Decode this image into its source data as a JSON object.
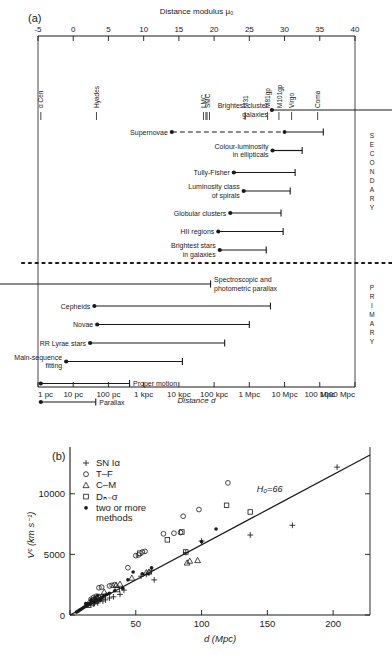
{
  "figure": {
    "panel_a_tag": "(a)",
    "panel_b_tag": "(b)"
  },
  "panel_a": {
    "top_axis_title": "Distance modulus μ₀",
    "bottom_axis_title": "Distance d",
    "top_ticks": [
      "-5",
      "0",
      "5",
      "10",
      "15",
      "20",
      "25",
      "30",
      "35",
      "40"
    ],
    "top_tick_values": [
      -5,
      0,
      5,
      10,
      15,
      20,
      25,
      30,
      35,
      40
    ],
    "bottom_ticks": [
      "1 pc",
      "10 pc",
      "100 pc",
      "1 kpc",
      "10 kpc",
      "100 kpc",
      "1 Mpc",
      "10 Mpc",
      "100 Mpc",
      "1000 Mpc"
    ],
    "side_label_secondary": "SECONDARY",
    "side_label_primary": "PRIMARY",
    "objects": [
      {
        "label": "α Cen",
        "mu": -4.6,
        "double": false
      },
      {
        "label": "Hyades",
        "mu": 3.3,
        "double": false
      },
      {
        "label": "LMC",
        "mu": 18.5,
        "double": true
      },
      {
        "label": "SMC",
        "mu": 19.0,
        "double": true
      },
      {
        "label": "M31",
        "mu": 24.4,
        "double": false
      },
      {
        "label": "M81gp",
        "mu": 27.6,
        "double": false
      },
      {
        "label": "M101gp",
        "mu": 29.2,
        "double": false
      },
      {
        "label": "Virgo",
        "mu": 31.0,
        "double": false
      },
      {
        "label": "Coma",
        "mu": 34.7,
        "double": false
      }
    ],
    "indicators_secondary": [
      {
        "label": "Brightest cluster galaxies",
        "lines": [
          "Brightest cluster",
          "galaxies"
        ],
        "dot": 28.2,
        "end": 41.5,
        "style": "solid",
        "label_side": "left",
        "overflow": true
      },
      {
        "label": "Supernovae",
        "lines": [
          "Supernovae"
        ],
        "dot": 14.0,
        "mid_dot": 30.0,
        "end": 35.5,
        "style": "dashed-then-solid",
        "label_side": "left",
        "overflow": false
      },
      {
        "label": "Colour-luminosity in ellipticals",
        "lines": [
          "Colour-luminosity",
          "in ellipticals"
        ],
        "dot": 28.3,
        "end": 32.5,
        "style": "solid",
        "label_side": "left",
        "overflow": false
      },
      {
        "label": "Tully-Fisher",
        "lines": [
          "Tully-Fisher"
        ],
        "dot": 22.8,
        "end": 31.5,
        "style": "solid",
        "label_side": "left",
        "overflow": false
      },
      {
        "label": "Luminosity class of spirals",
        "lines": [
          "Luminosity class",
          "of spirals"
        ],
        "dot": 24.2,
        "end": 30.8,
        "style": "solid",
        "label_side": "left",
        "overflow": false
      },
      {
        "label": "Globular clusters",
        "lines": [
          "Globular clusters"
        ],
        "dot": 22.3,
        "end": 29.5,
        "style": "solid",
        "label_side": "left",
        "overflow": false
      },
      {
        "label": "HII regions",
        "lines": [
          "HII regions"
        ],
        "dot": 20.6,
        "end": 29.8,
        "style": "solid",
        "label_side": "left",
        "overflow": false
      },
      {
        "label": "Brightest stars in galaxies",
        "lines": [
          "Brightest stars",
          "in galaxies"
        ],
        "dot": 20.8,
        "end": 27.4,
        "style": "solid",
        "label_side": "left",
        "overflow": false
      }
    ],
    "indicators_primary": [
      {
        "label": "Spectroscopic and photometric parallax",
        "lines": [
          "Spectroscopic and",
          "photometric parallax"
        ],
        "dot": -6.0,
        "end": 19.5,
        "style": "solid",
        "label_side": "right",
        "overflow": true
      },
      {
        "label": "Cepheids",
        "lines": [
          "Cepheids"
        ],
        "dot": 3.0,
        "end": 28.0,
        "style": "solid",
        "label_side": "left",
        "overflow": false
      },
      {
        "label": "Novae",
        "lines": [
          "Novae"
        ],
        "dot": 3.4,
        "end": 25.0,
        "style": "solid",
        "label_side": "left",
        "overflow": false
      },
      {
        "label": "RR Lyrae stars",
        "lines": [
          "RR Lyrae stars"
        ],
        "dot": 2.4,
        "end": 21.5,
        "style": "solid",
        "label_side": "left",
        "overflow": false
      },
      {
        "label": "Main-sequence fitting",
        "lines": [
          "Main-sequence",
          "fitting"
        ],
        "dot": -1.0,
        "end": 15.5,
        "style": "solid",
        "label_side": "left",
        "overflow": false
      },
      {
        "label": "Proper motion",
        "lines": [
          "Proper motion"
        ],
        "dot": -4.6,
        "end": 8.0,
        "style": "solid",
        "label_side": "right",
        "overflow": false
      },
      {
        "label": "Parallax",
        "lines": [
          "Parallax"
        ],
        "dot": -4.6,
        "end": 3.2,
        "style": "solid",
        "label_side": "right",
        "overflow": false
      }
    ]
  },
  "chart_data": {
    "type": "scatter",
    "title": "",
    "xlabel": "d (Mpc)",
    "ylabel": "Vᶜ (km s⁻¹)",
    "xlim": [
      0,
      228
    ],
    "ylim": [
      0,
      13200
    ],
    "xticks": [
      0,
      50,
      100,
      150,
      200
    ],
    "xtick_labels": [
      "0",
      "50",
      "100",
      "150",
      "200"
    ],
    "yticks": [
      0,
      5000,
      10000
    ],
    "ytick_labels": [
      "0",
      "5000",
      "10000"
    ],
    "grid": false,
    "legend_position": "upper-left",
    "annotation": "H₀=66",
    "fit_line": {
      "slope": 66,
      "label": "H₀=66",
      "x_from": 0,
      "x_to": 228
    },
    "legend": [
      {
        "marker": "plus",
        "label": "SN Iα"
      },
      {
        "marker": "circle-open",
        "label": "T–F"
      },
      {
        "marker": "triangle-open",
        "label": "C–M"
      },
      {
        "marker": "square-open",
        "label": "Dₙ₋σ"
      },
      {
        "marker": "dot-filled",
        "label": "two or more methods"
      }
    ],
    "series": [
      {
        "name": "SN Iα",
        "marker": "plus",
        "points": [
          [
            203,
            12200
          ],
          [
            137,
            6600
          ],
          [
            169,
            7400
          ],
          [
            100,
            6100
          ],
          [
            88,
            5150
          ],
          [
            62,
            3700
          ],
          [
            58,
            3350
          ],
          [
            60,
            3450
          ],
          [
            64,
            2900
          ],
          [
            54,
            3200
          ],
          [
            41,
            2050
          ],
          [
            38,
            1700
          ],
          [
            33,
            1500
          ],
          [
            30,
            1400
          ],
          [
            27,
            1250
          ],
          [
            25,
            1150
          ],
          [
            21,
            1000
          ],
          [
            18,
            900
          ]
        ]
      },
      {
        "name": "T–F",
        "marker": "circle-open",
        "points": [
          [
            120,
            10900
          ],
          [
            86,
            8150
          ],
          [
            98,
            8700
          ],
          [
            84,
            6800
          ],
          [
            71,
            6700
          ],
          [
            79,
            6750
          ],
          [
            55,
            5200
          ],
          [
            52,
            4950
          ],
          [
            50,
            4900
          ],
          [
            57,
            5250
          ],
          [
            44,
            3900
          ],
          [
            30,
            2400
          ],
          [
            32,
            2450
          ],
          [
            34,
            2500
          ],
          [
            24,
            2300
          ],
          [
            22,
            2250
          ],
          [
            20,
            1550
          ],
          [
            18,
            1450
          ],
          [
            16,
            1300
          ],
          [
            17,
            1200
          ],
          [
            15,
            1000
          ],
          [
            13,
            850
          ]
        ]
      },
      {
        "name": "C–M",
        "marker": "triangle-open",
        "points": [
          [
            91,
            4450
          ],
          [
            97,
            4500
          ],
          [
            89,
            4300
          ],
          [
            60,
            3550
          ],
          [
            58,
            3500
          ],
          [
            47,
            3050
          ],
          [
            38,
            2550
          ],
          [
            35,
            2450
          ],
          [
            26,
            1900
          ],
          [
            22,
            1500
          ],
          [
            18,
            1200
          ],
          [
            14,
            800
          ]
        ]
      },
      {
        "name": "Dₙ₋σ",
        "marker": "square-open",
        "points": [
          [
            119,
            9050
          ],
          [
            137,
            8500
          ],
          [
            85,
            6850
          ],
          [
            74,
            6200
          ],
          [
            88,
            5200
          ],
          [
            53,
            5100
          ],
          [
            36,
            2100
          ],
          [
            25,
            1500
          ],
          [
            20,
            1150
          ],
          [
            17,
            950
          ]
        ]
      },
      {
        "name": "two or more methods",
        "marker": "dot-filled",
        "points": [
          [
            111,
            7100
          ],
          [
            100,
            6050
          ],
          [
            62,
            3900
          ],
          [
            48,
            3550
          ],
          [
            55,
            3400
          ],
          [
            44,
            2900
          ],
          [
            40,
            2200
          ],
          [
            34,
            2000
          ],
          [
            30,
            1800
          ],
          [
            28,
            1700
          ],
          [
            26,
            1600
          ],
          [
            25,
            1500
          ],
          [
            24,
            1420
          ],
          [
            23,
            1350
          ],
          [
            22,
            1300
          ],
          [
            21,
            1250
          ],
          [
            20,
            1200
          ],
          [
            19,
            1150
          ],
          [
            18,
            1100
          ],
          [
            17,
            1050
          ],
          [
            16,
            1000
          ],
          [
            15,
            950
          ],
          [
            14,
            880
          ],
          [
            13,
            800
          ],
          [
            12,
            740
          ],
          [
            11,
            660
          ],
          [
            10,
            600
          ],
          [
            9,
            520
          ],
          [
            8,
            450
          ],
          [
            7,
            380
          ],
          [
            6,
            300
          ],
          [
            5,
            240
          ],
          [
            19,
            1450
          ],
          [
            21,
            1600
          ],
          [
            23,
            1200
          ],
          [
            16,
            1250
          ],
          [
            12,
            950
          ]
        ]
      }
    ]
  }
}
